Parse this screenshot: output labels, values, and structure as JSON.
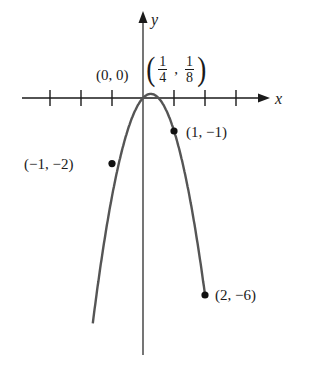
{
  "chart_data": {
    "type": "line",
    "title": "",
    "function": "y = x - 2x^2",
    "xlabel": "x",
    "ylabel": "y",
    "xlim": [
      -4,
      4
    ],
    "ylim": [
      -7.5,
      2.6
    ],
    "grid": false,
    "x_ticks": [
      -3,
      -2,
      -1,
      1,
      2,
      3
    ],
    "series": [
      {
        "name": "parabola",
        "x": [
          -2.2,
          -1.5,
          -1,
          -0.5,
          0,
          0.25,
          0.5,
          1,
          1.5,
          2,
          2.2
        ],
        "y": [
          -11.88,
          -6,
          -2,
          -1,
          0,
          0.125,
          0,
          -1,
          -3,
          -6,
          -7.48
        ]
      }
    ],
    "annotations": [
      {
        "point": [
          0,
          0
        ],
        "label": "(0, 0)",
        "marker": false
      },
      {
        "point": [
          0.25,
          0.125
        ],
        "label": "(1/4, 1/8)",
        "marker": false
      },
      {
        "point": [
          1,
          -1
        ],
        "label": "(1, −1)",
        "marker": true
      },
      {
        "point": [
          -1,
          -2
        ],
        "label": "(−1, −2)",
        "marker": true
      },
      {
        "point": [
          2,
          -6
        ],
        "label": "(2, −6)",
        "marker": true
      }
    ]
  },
  "labels": {
    "x_axis": "x",
    "y_axis": "y",
    "origin": "(0, 0)",
    "vertex_num1": "1",
    "vertex_den1": "4",
    "vertex_num2": "1",
    "vertex_den2": "8",
    "vertex_open": "(",
    "vertex_close": ")",
    "vertex_comma": ",",
    "p1": "(1, −1)",
    "p2": "(−1, −2)",
    "p3": "(2, −6)"
  }
}
